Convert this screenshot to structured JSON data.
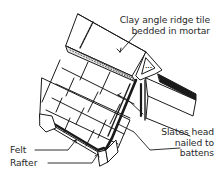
{
  "diagram": {
    "labels": {
      "ridge_tile_line1": "Clay angle ridge tile",
      "ridge_tile_line2": "bedded in mortar",
      "slates_line1": "Slates head",
      "slates_line2": "nailed to",
      "slates_line3": "battens",
      "felt": "Felt",
      "rafter": "Rafter"
    },
    "colors": {
      "line": "#1a1a1a",
      "text": "#2a2a2a",
      "background": "#ffffff"
    }
  }
}
